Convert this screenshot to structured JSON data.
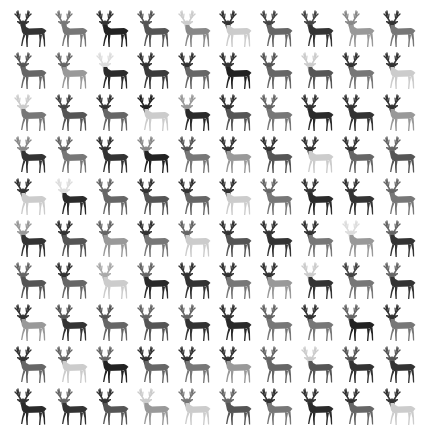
{
  "grid": {
    "rows": 10,
    "cols": 10,
    "col_pitch": 41,
    "row_pitch": 42,
    "subject": "deer silhouette",
    "cells": [
      [
        [
          "#333333",
          "#333333"
        ],
        [
          "#777777",
          "#777777"
        ],
        [
          "#333333",
          "#222222"
        ],
        [
          "#555555",
          "#555555"
        ],
        [
          "#cccccc",
          "#888888"
        ],
        [
          "#333333",
          "#cccccc"
        ],
        [
          "#444444",
          "#666666"
        ],
        [
          "#444444",
          "#333333"
        ],
        [
          "#888888",
          "#999999"
        ],
        [
          "#333333",
          "#777777"
        ]
      ],
      [
        [
          "#555555",
          "#666666"
        ],
        [
          "#666666",
          "#999999"
        ],
        [
          "#dddddd",
          "#2a2a2a"
        ],
        [
          "#333333",
          "#3a3a3a"
        ],
        [
          "#333333",
          "#666666"
        ],
        [
          "#333333",
          "#222222"
        ],
        [
          "#555555",
          "#666666"
        ],
        [
          "#cccccc",
          "#555555"
        ],
        [
          "#333333",
          "#777777"
        ],
        [
          "#333333",
          "#cccccc"
        ]
      ],
      [
        [
          "#cccccc",
          "#777777"
        ],
        [
          "#444444",
          "#555555"
        ],
        [
          "#333333",
          "#666666"
        ],
        [
          "#222222",
          "#cccccc"
        ],
        [
          "#999999",
          "#2a2a2a"
        ],
        [
          "#333333",
          "#555555"
        ],
        [
          "#666666",
          "#777777"
        ],
        [
          "#333333",
          "#2a2a2a"
        ],
        [
          "#333333",
          "#333333"
        ],
        [
          "#333333",
          "#999999"
        ]
      ],
      [
        [
          "#888888",
          "#333333"
        ],
        [
          "#666666",
          "#777777"
        ],
        [
          "#333333",
          "#333333"
        ],
        [
          "#888888",
          "#222222"
        ],
        [
          "#555555",
          "#777777"
        ],
        [
          "#333333",
          "#999999"
        ],
        [
          "#333333",
          "#555555"
        ],
        [
          "#333333",
          "#cccccc"
        ],
        [
          "#333333",
          "#666666"
        ],
        [
          "#666666",
          "#555555"
        ]
      ],
      [
        [
          "#333333",
          "#cccccc"
        ],
        [
          "#dddddd",
          "#2a2a2a"
        ],
        [
          "#666666",
          "#666666"
        ],
        [
          "#333333",
          "#555555"
        ],
        [
          "#333333",
          "#666666"
        ],
        [
          "#333333",
          "#cccccc"
        ],
        [
          "#666666",
          "#777777"
        ],
        [
          "#333333",
          "#2a2a2a"
        ],
        [
          "#333333",
          "#333333"
        ],
        [
          "#666666",
          "#777777"
        ]
      ],
      [
        [
          "#999999",
          "#333333"
        ],
        [
          "#333333",
          "#555555"
        ],
        [
          "#666666",
          "#999999"
        ],
        [
          "#333333",
          "#777777"
        ],
        [
          "#666666",
          "#cccccc"
        ],
        [
          "#333333",
          "#555555"
        ],
        [
          "#333333",
          "#333333"
        ],
        [
          "#333333",
          "#777777"
        ],
        [
          "#dddddd",
          "#999999"
        ],
        [
          "#666666",
          "#333333"
        ]
      ],
      [
        [
          "#666666",
          "#555555"
        ],
        [
          "#333333",
          "#666666"
        ],
        [
          "#aaaaaa",
          "#cccccc"
        ],
        [
          "#666666",
          "#2a2a2a"
        ],
        [
          "#333333",
          "#333333"
        ],
        [
          "#333333",
          "#777777"
        ],
        [
          "#333333",
          "#999999"
        ],
        [
          "#cccccc",
          "#333333"
        ],
        [
          "#444444",
          "#777777"
        ],
        [
          "#666666",
          "#333333"
        ]
      ],
      [
        [
          "#333333",
          "#999999"
        ],
        [
          "#555555",
          "#333333"
        ],
        [
          "#555555",
          "#666666"
        ],
        [
          "#666666",
          "#555555"
        ],
        [
          "#666666",
          "#333333"
        ],
        [
          "#333333",
          "#2a2a2a"
        ],
        [
          "#666666",
          "#777777"
        ],
        [
          "#333333",
          "#777777"
        ],
        [
          "#666666",
          "#222222"
        ],
        [
          "#333333",
          "#777777"
        ]
      ],
      [
        [
          "#333333",
          "#666666"
        ],
        [
          "#666666",
          "#cccccc"
        ],
        [
          "#666666",
          "#222222"
        ],
        [
          "#333333",
          "#666666"
        ],
        [
          "#333333",
          "#777777"
        ],
        [
          "#333333",
          "#999999"
        ],
        [
          "#666666",
          "#666666"
        ],
        [
          "#cccccc",
          "#555555"
        ],
        [
          "#555555",
          "#333333"
        ],
        [
          "#555555",
          "#333333"
        ]
      ],
      [
        [
          "#333333",
          "#2a2a2a"
        ],
        [
          "#666666",
          "#333333"
        ],
        [
          "#333333",
          "#555555"
        ],
        [
          "#cccccc",
          "#999999"
        ],
        [
          "#777777",
          "#cccccc"
        ],
        [
          "#666666",
          "#555555"
        ],
        [
          "#333333",
          "#777777"
        ],
        [
          "#333333",
          "#2a2a2a"
        ],
        [
          "#333333",
          "#666666"
        ],
        [
          "#333333",
          "#cccccc"
        ]
      ]
    ]
  }
}
